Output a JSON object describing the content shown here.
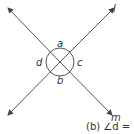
{
  "diagram": {
    "lines": [
      {
        "name": "l",
        "label": "l"
      },
      {
        "name": "m",
        "label": "m"
      }
    ],
    "angles": {
      "a": "a",
      "b": "b",
      "c": "c",
      "d": "d"
    },
    "caption": "(b) ∠d = ."
  }
}
